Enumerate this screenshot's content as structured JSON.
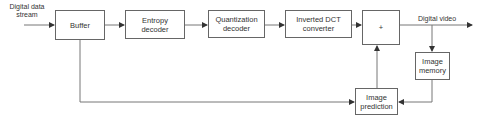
{
  "diagram": {
    "input_label_line1": "Digital data",
    "input_label_line2": "stream",
    "output_label": "Digital video",
    "blocks": {
      "buffer": "Buffer",
      "entropy_l1": "Entropy",
      "entropy_l2": "decoder",
      "quant_l1": "Quantization",
      "quant_l2": "decoder",
      "idct_l1": "Inverted DCT",
      "idct_l2": "converter",
      "adder": "+",
      "memory_l1": "Image",
      "memory_l2": "memory",
      "prediction_l1": "Image",
      "prediction_l2": "prediction"
    },
    "colors": {
      "line": "#666666",
      "box_border": "#666666",
      "text": "#333333"
    }
  }
}
